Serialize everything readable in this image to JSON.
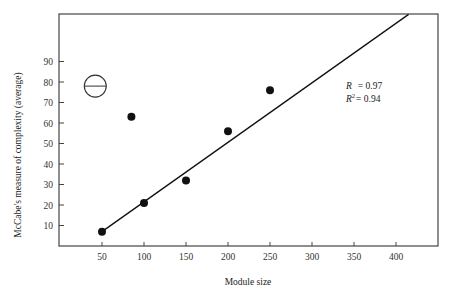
{
  "chart_data": {
    "type": "scatter",
    "title": "",
    "xlabel": "Module size",
    "ylabel": "McCabe's measure of complexity (average)",
    "xlim": [
      0,
      450
    ],
    "ylim": [
      0,
      110
    ],
    "x_ticks": [
      50,
      100,
      150,
      200,
      250,
      300,
      350,
      400
    ],
    "y_ticks": [
      10,
      20,
      30,
      40,
      50,
      60,
      70,
      80,
      90
    ],
    "grid": false,
    "legend": null,
    "series": [
      {
        "name": "modules",
        "marker": "filled-circle",
        "points": [
          {
            "x": 50,
            "y": 7
          },
          {
            "x": 85,
            "y": 63
          },
          {
            "x": 100,
            "y": 21
          },
          {
            "x": 150,
            "y": 32
          },
          {
            "x": 200,
            "y": 56
          },
          {
            "x": 250,
            "y": 76
          }
        ]
      },
      {
        "name": "outlier-marker",
        "marker": "open-circle-with-bar",
        "points": [
          {
            "x": 42,
            "y": 78
          }
        ]
      }
    ],
    "regression_line": {
      "x_start": 50,
      "y_start": 7,
      "x_end": 415,
      "y_end": 113
    },
    "annotations": {
      "r_label": "R",
      "r_value": "= 0.97",
      "r2_label": "R",
      "r2_sup": "2",
      "r2_value": "= 0.94"
    }
  }
}
